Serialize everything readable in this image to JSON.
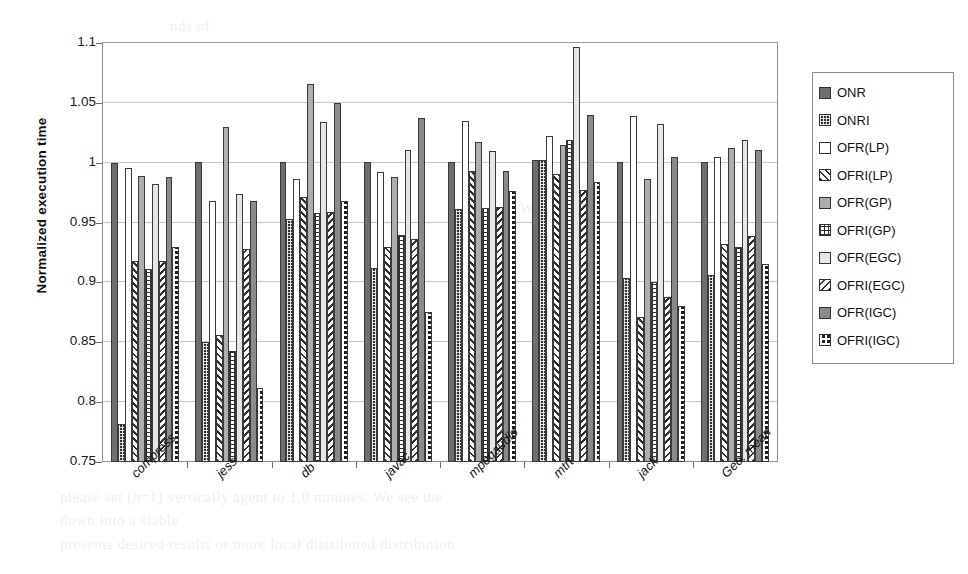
{
  "chart_data": {
    "type": "bar",
    "title": "",
    "xlabel": "",
    "ylabel": "Normalized execution time",
    "ylim": [
      0.75,
      1.1
    ],
    "ytick_step": 0.05,
    "yticks": [
      "1.1",
      "1.05",
      "1",
      "0.95",
      "0.9",
      "0.85",
      "0.8",
      "0.75"
    ],
    "grid": true,
    "legend_position": "right",
    "categories": [
      "compress",
      "jess",
      "db",
      "javac",
      "mpegaudio",
      "mtrt",
      "jack",
      "Geo. mean"
    ],
    "series": [
      {
        "name": "ONR",
        "pattern": "solid-dark-gray",
        "color": "#6e6e6e",
        "values": [
          1.0,
          1.001,
          1.001,
          1.001,
          1.001,
          1.002,
          1.001,
          1.001
        ]
      },
      {
        "name": "ONRI",
        "pattern": "dark-fine-grid",
        "color": "#2e2e2e",
        "values": [
          0.782,
          0.85,
          0.953,
          0.912,
          0.961,
          1.002,
          0.904,
          0.906
        ]
      },
      {
        "name": "OFR(LP)",
        "pattern": "white-empty",
        "color": "#ffffff",
        "values": [
          0.996,
          0.968,
          0.986,
          0.992,
          1.035,
          1.022,
          1.039,
          1.005
        ]
      },
      {
        "name": "OFRI(LP)",
        "pattern": "diagonal-hatch-up",
        "color": "#ffffff",
        "values": [
          0.918,
          0.856,
          0.971,
          0.93,
          0.993,
          0.991,
          0.871,
          0.932
        ]
      },
      {
        "name": "OFR(GP)",
        "pattern": "solid-medium-gray",
        "color": "#adadad",
        "values": [
          0.989,
          1.03,
          1.066,
          0.988,
          1.017,
          1.015,
          0.986,
          1.012
        ]
      },
      {
        "name": "OFRI(GP)",
        "pattern": "crosshatch-grid",
        "color": "#ffffff",
        "values": [
          0.911,
          0.843,
          0.958,
          0.94,
          0.962,
          1.019,
          0.9,
          0.93
        ]
      },
      {
        "name": "OFR(EGC)",
        "pattern": "solid-light-gray",
        "color": "#e6e6e6",
        "values": [
          0.982,
          0.974,
          1.034,
          1.011,
          1.01,
          1.097,
          1.032,
          1.019
        ]
      },
      {
        "name": "OFRI(EGC)",
        "pattern": "diagonal-hatch-down",
        "color": "#ffffff",
        "values": [
          0.918,
          0.928,
          0.959,
          0.936,
          0.963,
          0.977,
          0.888,
          0.939
        ]
      },
      {
        "name": "OFR(IGC)",
        "pattern": "solid-gray",
        "color": "#8a8a8a",
        "values": [
          0.988,
          0.968,
          1.05,
          1.037,
          0.993,
          1.04,
          1.005,
          1.011
        ]
      },
      {
        "name": "OFRI(IGC)",
        "pattern": "checkered",
        "color": "#1f1f1f",
        "values": [
          0.93,
          0.812,
          0.968,
          0.875,
          0.976,
          0.984,
          0.88,
          0.915
        ]
      }
    ]
  },
  "legend": {
    "items": [
      {
        "label": "ONR"
      },
      {
        "label": "ONRI"
      },
      {
        "label": "OFR(LP)"
      },
      {
        "label": "OFRI(LP)"
      },
      {
        "label": "OFR(GP)"
      },
      {
        "label": "OFRI(GP)"
      },
      {
        "label": "OFR(EGC)"
      },
      {
        "label": "OFRI(EGC)"
      },
      {
        "label": "OFR(IGC)"
      },
      {
        "label": "OFRI(IGC)"
      }
    ]
  },
  "background_text": [
    {
      "text": "please set (h=1) vertically agent to 1.0 minutes. We see the",
      "x": 60,
      "y": 489
    },
    {
      "text": "down into a stable",
      "x": 60,
      "y": 512
    },
    {
      "text": "presents desired results or more local distributed distribution",
      "x": 60,
      "y": 536
    },
    {
      "text": "nds of",
      "x": 170,
      "y": 18
    },
    {
      "text": "W.",
      "x": 520,
      "y": 200
    }
  ]
}
